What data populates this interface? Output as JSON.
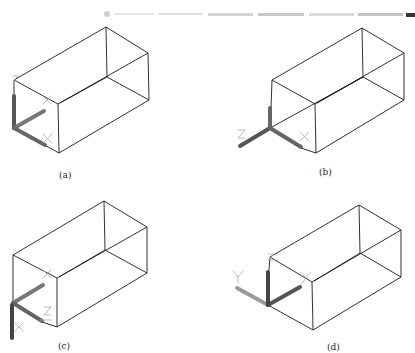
{
  "figure": {
    "panels": [
      {
        "id": "a",
        "caption": "(a)",
        "ucs_labels": [
          "Z",
          "X",
          "X"
        ]
      },
      {
        "id": "b",
        "caption": "(b)",
        "ucs_labels": [
          "Z",
          "X"
        ]
      },
      {
        "id": "c",
        "caption": "(c)",
        "ucs_labels": [
          "X",
          "Z",
          "X"
        ]
      },
      {
        "id": "d",
        "caption": "(d)",
        "ucs_labels": [
          "Y",
          "Y",
          "X"
        ]
      }
    ]
  },
  "colors": {
    "line": "#1a1a1a",
    "axis_dark": "#555555",
    "axis_light": "#9a9a9a",
    "glyph": "#aaaaaa"
  }
}
